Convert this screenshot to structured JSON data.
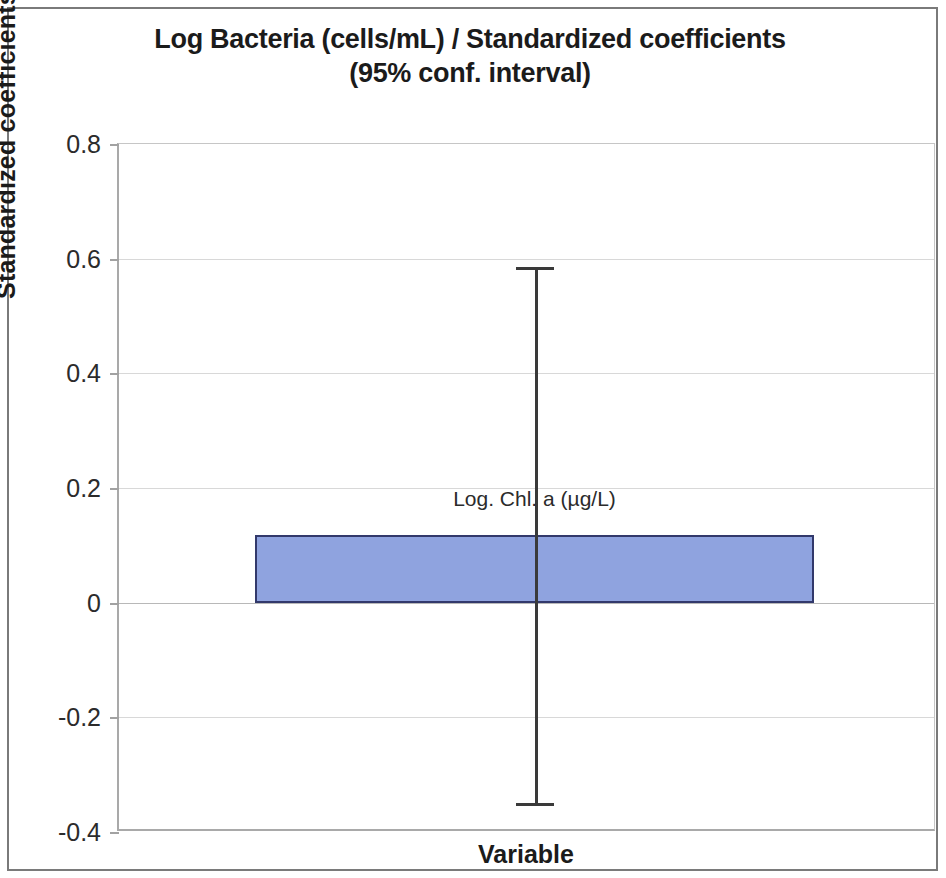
{
  "chart_data": {
    "type": "bar",
    "title": "Log Bacteria (cells/mL) / Standardized coefficients",
    "subtitle": "(95% conf. interval)",
    "xlabel": "Variable",
    "ylabel": "Standardized coefficients",
    "categories": [
      "Log. Chl. a (µg/L)"
    ],
    "values": [
      0.118
    ],
    "error_low": [
      -0.35
    ],
    "error_high": [
      0.585
    ],
    "point_labels": [
      "Log. Chl. a (µg/L)"
    ],
    "ylim": [
      -0.4,
      0.8
    ],
    "yticks": [
      0.8,
      0.6,
      0.4,
      0.2,
      0,
      -0.2,
      -0.4
    ],
    "ytick_labels": [
      "0.8",
      "0.6",
      "0.4",
      "0.2",
      "0",
      "-0.2",
      "-0.4"
    ],
    "grid": true,
    "legend": false,
    "bar_color": "#8fa3df",
    "bar_border_color": "#32396b",
    "error_color": "#3a3a3a",
    "zero_line": 0
  },
  "figure": {
    "frame_color": "#7a7a7a",
    "background": "#ffffff"
  }
}
